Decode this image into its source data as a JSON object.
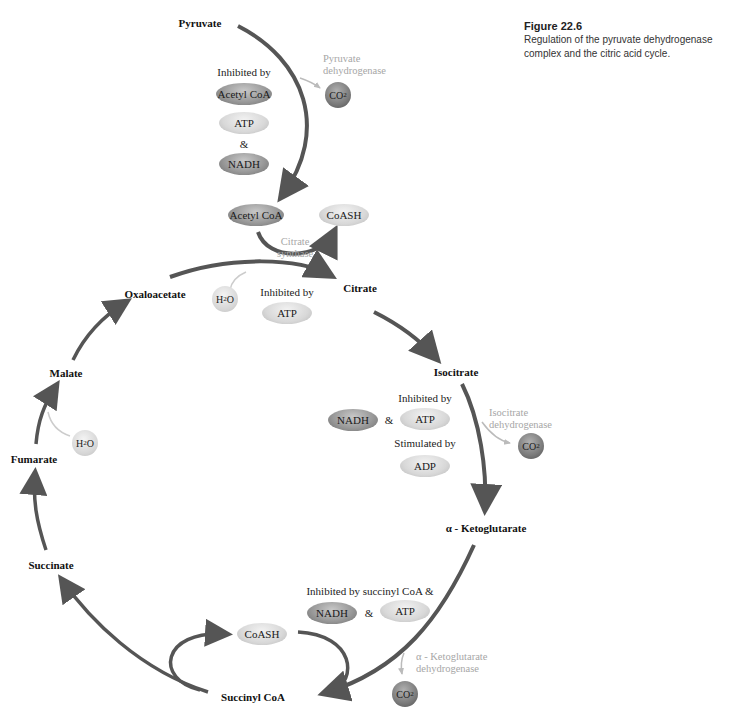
{
  "caption": {
    "figure_label": "Figure 22.6",
    "line1": "Regulation of the pyruvate dehydrogenase",
    "line2": "complex and the citric acid cycle."
  },
  "metabolites": {
    "pyruvate": "Pyruvate",
    "citrate": "Citrate",
    "isocitrate": "Isocitrate",
    "alpha_ketoglutarate": "α - Ketoglutarate",
    "succinyl_coa": "Succinyl CoA",
    "succinate": "Succinate",
    "fumarate": "Fumarate",
    "malate": "Malate",
    "oxaloacetate": "Oxaloacetate"
  },
  "enzymes": {
    "pdh_line1": "Pyruvate",
    "pdh_line2": "dehydrogenase",
    "cs_line1": "Citrate",
    "cs_line2": "synthase",
    "idh_line1": "Isocitrate",
    "idh_line2": "dehydrogenase",
    "akgdh_line1": "α - Ketoglutarate",
    "akgdh_line2": "dehydrogenase"
  },
  "pdh_regulation": {
    "label": "Inhibited by",
    "items": [
      "Acetyl CoA",
      "ATP",
      "NADH"
    ],
    "joiner": "&"
  },
  "citrate_synthase_regulation": {
    "label": "Inhibited by",
    "items": [
      "ATP"
    ]
  },
  "idh_regulation": {
    "inhibited_label": "Inhibited by",
    "inhibitors": [
      "NADH",
      "ATP"
    ],
    "joiner": "&",
    "stimulated_label": "Stimulated by",
    "stimulators": [
      "ADP"
    ]
  },
  "akgdh_regulation": {
    "label": "Inhibited by succinyl CoA &",
    "items": [
      "NADH",
      "ATP"
    ],
    "joiner": "&"
  },
  "molecules": {
    "acetyl_coa": "Acetyl CoA",
    "coash": "CoASH",
    "coash_succinyl": "CoASH",
    "co2_main": "CO",
    "co2_sub": "2",
    "h2o_main_a": "H",
    "h2o_sub": "2",
    "h2o_main_b": "O"
  }
}
